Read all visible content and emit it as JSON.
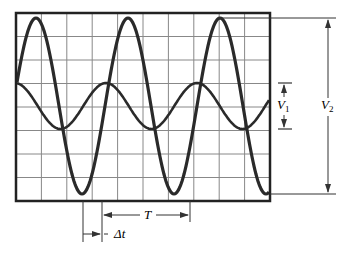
{
  "diagram": {
    "screen": {
      "x": 16,
      "y": 13,
      "width": 254,
      "height": 188,
      "divisions_x": 10,
      "divisions_y": 8,
      "frame_color": "#222222",
      "grid_color": "#888888"
    },
    "waveforms": [
      {
        "name": "large-wave",
        "x_peak0": 36,
        "period": 92,
        "y_center": 106,
        "amplitude": 88,
        "color": "#2a2a2a",
        "width": 3.2
      },
      {
        "name": "small-wave",
        "x_peak0": 15,
        "period": 91,
        "y_center": 106,
        "amplitude": 23,
        "color": "#2a2a2a",
        "width": 2.6
      }
    ],
    "annotations": {
      "V1": {
        "label": "V",
        "sub": "1",
        "x": 284,
        "y_top": 83,
        "y_bottom": 129
      },
      "V2": {
        "label": "V",
        "sub": "2",
        "x": 328,
        "y_top": 18,
        "y_bottom": 194
      },
      "T": {
        "label": "T",
        "x_left": 102,
        "x_right": 190,
        "y": 215
      },
      "dt": {
        "label": "Δt",
        "x_left": 83,
        "x_right": 102,
        "y": 234
      }
    },
    "line_color": "#333333"
  }
}
